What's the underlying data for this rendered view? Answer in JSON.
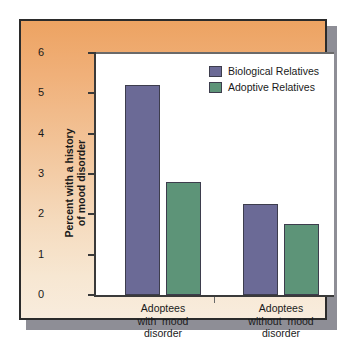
{
  "chart_data": {
    "type": "bar",
    "title": "",
    "xlabel": "",
    "ylabel": "Percent with a history of mood disorder",
    "ylabel_lines": [
      "Percent with a history",
      "of mood disorder"
    ],
    "ylim": [
      0,
      6
    ],
    "yticks": [
      0,
      1,
      2,
      3,
      4,
      5,
      6
    ],
    "ytick_labels": [
      "0",
      "1",
      "2",
      "3",
      "4",
      "5",
      "6"
    ],
    "grid": false,
    "legend_position": "top-right",
    "categories": [
      "Adoptees with mood disorder",
      "Adoptees without mood disorder"
    ],
    "category_label_lines": [
      [
        "Adoptees",
        "with  mood",
        "disorder"
      ],
      [
        "Adoptees",
        "without  mood",
        "disorder"
      ]
    ],
    "series": [
      {
        "name": "Biological Relatives",
        "color": "#6b6a96",
        "values": [
          5.2,
          2.25
        ]
      },
      {
        "name": "Adoptive Relatives",
        "color": "#5d9478",
        "values": [
          2.8,
          1.75
        ]
      }
    ]
  },
  "legend": {
    "items": [
      {
        "label": "Biological Relatives",
        "color": "#6b6a96"
      },
      {
        "label": "Adoptive Relatives",
        "color": "#5d9478"
      }
    ]
  },
  "colors": {
    "biological": "#6b6a96",
    "adoptive": "#5d9478",
    "frame_top": "#eda362",
    "frame_bottom": "#f8ecdd",
    "border": "#2b2b2b",
    "shadow": "#8e8e96",
    "plot_background": "#ffffff",
    "axis": "#3a3a3a"
  }
}
